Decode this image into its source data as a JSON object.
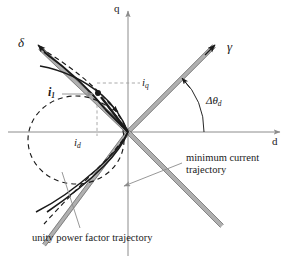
{
  "figure": {
    "type": "vector-diagram",
    "background_color": "#ffffff",
    "width": 290,
    "height": 263
  },
  "colors": {
    "axis": "#8c8c8c",
    "curve_solid": "#1a1a1a",
    "curve_dashed": "#1a1a1a",
    "gray_axis": "#a3a3a3",
    "gray_axis_edge": "#6e6e6e",
    "leader": "#8c8c8c",
    "text": "#1a1a1a",
    "guide_dashed": "#9a9a9a"
  },
  "axes": {
    "origin": {
      "x": 128,
      "y": 132
    },
    "q": {
      "label": "q",
      "x": 116,
      "y": 4,
      "direction": "up",
      "tip": {
        "x": 128,
        "y": 10
      }
    },
    "d": {
      "label": "d",
      "x": 272,
      "y": 137,
      "direction": "right",
      "tip": {
        "x": 282,
        "y": 132
      }
    },
    "gamma": {
      "label": "γ",
      "x": 227,
      "y": 42,
      "angle_deg": 45,
      "tip": {
        "x": 216,
        "y": 44
      },
      "style": "gray-double-line-with-black-arrow"
    },
    "delta": {
      "label": "δ",
      "x": 18,
      "y": 38,
      "angle_deg": 131,
      "tip": {
        "x": 36,
        "y": 42
      },
      "style": "gray-double-line-with-black-arrow"
    }
  },
  "labels": {
    "current_vector": {
      "base": "i",
      "sub": "1"
    },
    "iq": {
      "base": "i",
      "sub": "q",
      "x": 141,
      "y": 77
    },
    "id": {
      "base": "i",
      "sub": "d",
      "x": 73,
      "y": 137
    },
    "delta_theta_d": {
      "base": "Δθ",
      "sub": "d",
      "x": 208,
      "y": 96
    },
    "minimum_current_trajectory": {
      "line1": "minimum current",
      "line2": "trajectory",
      "x": 186,
      "y": 160
    },
    "unity_power_factor_trajectory": {
      "text": "unity power factor trajectory",
      "x": 32,
      "y": 236
    }
  },
  "annotations": {
    "operating_point": {
      "x": 97,
      "y": 93
    },
    "angle_arc_radius": 72,
    "angle_arc_from_deg": 0,
    "angle_arc_to_deg": 45
  }
}
